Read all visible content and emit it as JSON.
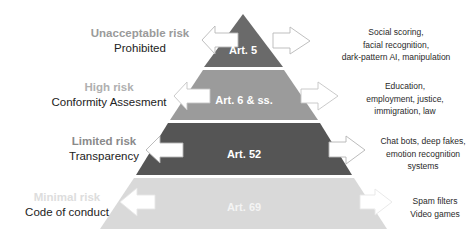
{
  "tiers": [
    {
      "risk": "Unacceptable risk",
      "regime": "Prohibited",
      "article": "Art. 5",
      "examples": [
        "Social scoring,",
        "facial recognition,",
        "dark-pattern AI, manipulation"
      ],
      "fill": "#6a6a6a",
      "risk_color": "#9a9a9a",
      "arrow_color": "#b8b8b8"
    },
    {
      "risk": "High risk",
      "regime": "Conformity Assesment",
      "article": "Art. 6 & ss.",
      "examples": [
        "Education,",
        "employment, justice,",
        "immigration, law"
      ],
      "fill": "#9b9b9b",
      "risk_color": "#b0b0b0",
      "arrow_color": "#c4c4c4"
    },
    {
      "risk": "Limited risk",
      "regime": "Transparency",
      "article": "Art. 52",
      "examples": [
        "Chat bots, deep fakes,",
        "emotion recognition",
        "systems"
      ],
      "fill": "#555555",
      "risk_color": "#8a8a8a",
      "arrow_color": "#b4b4b4"
    },
    {
      "risk": "Minimal risk",
      "regime": "Code of conduct",
      "article": "Art. 69",
      "examples": [
        "Spam filters",
        "Video games"
      ],
      "fill": "#d9d9d9",
      "risk_color": "#dddddd",
      "arrow_color": "#e2e2e2"
    }
  ]
}
